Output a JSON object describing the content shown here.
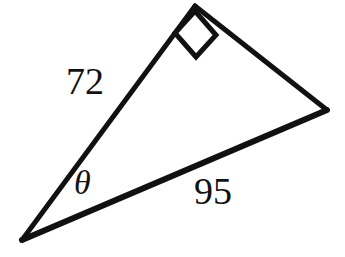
{
  "figure": {
    "kind": "right-triangle-diagram",
    "background_color": "#ffffff",
    "stroke_color": "#111111",
    "canvas": {
      "width": 345,
      "height": 257
    },
    "vertices": {
      "left_angle_vertex": {
        "x": 22,
        "y": 240
      },
      "top_right_angle_vertex": {
        "x": 195,
        "y": 6
      },
      "right_vertex": {
        "x": 327,
        "y": 110
      }
    },
    "edges": [
      {
        "name": "leg-72",
        "from": "left_angle_vertex",
        "to": "top_right_angle_vertex",
        "stroke_width": 5
      },
      {
        "name": "leg-unlabeled",
        "from": "top_right_angle_vertex",
        "to": "right_vertex",
        "stroke_width": 5
      },
      {
        "name": "hypotenuse-95",
        "from": "right_vertex",
        "to": "left_angle_vertex",
        "stroke_width": 6
      }
    ],
    "right_angle_marker": {
      "name": "right-angle-square",
      "stroke_width": 5,
      "points": "195,12 215,36 196,56 176,33"
    }
  },
  "labels": {
    "side_a": "72",
    "side_b": "95",
    "angle": "θ"
  }
}
